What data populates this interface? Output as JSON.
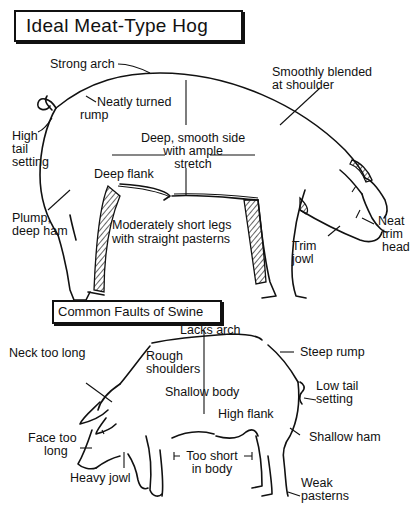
{
  "diagram": {
    "ideal": {
      "title": "Ideal Meat-Type Hog",
      "labels": {
        "strong_arch": "Strong arch",
        "neatly_turned_1": "Neatly turned",
        "neatly_turned_2": "rump",
        "high_tail_1": "High",
        "high_tail_2": "tail",
        "high_tail_3": "setting",
        "smoothly_1": "Smoothly blended",
        "smoothly_2": "at shoulder",
        "deep_side_1": "Deep, smooth side",
        "deep_side_2": "with ample",
        "deep_side_3": "stretch",
        "deep_flank": "Deep flank",
        "plump_1": "Plump,",
        "plump_2": "deep ham",
        "legs_1": "Moderately short legs",
        "legs_2": "with straight pasterns",
        "trim_jowl_1": "Trim",
        "trim_jowl_2": "jowl",
        "neat_head_1": "Neat",
        "neat_head_2": "trim",
        "neat_head_3": "head"
      }
    },
    "faults": {
      "title": "Common Faults of Swine",
      "labels": {
        "lacks_arch": "Lacks arch",
        "neck_long": "Neck too long",
        "rough_1": "Rough",
        "rough_2": "shoulders",
        "steep_rump": "Steep rump",
        "shallow_body": "Shallow body",
        "low_tail_1": "Low tail",
        "low_tail_2": "setting",
        "high_flank": "High flank",
        "face_1": "Face too",
        "face_2": "long",
        "too_short_1": "Too short",
        "too_short_2": "in body",
        "shallow_ham": "Shallow ham",
        "heavy_jowl": "Heavy jowl",
        "weak_1": "Weak",
        "weak_2": "pasterns"
      }
    }
  }
}
